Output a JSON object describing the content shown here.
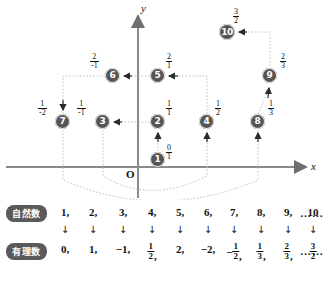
{
  "figure": {
    "axis": {
      "x_label": "x",
      "y_label": "y",
      "origin_label": "O"
    },
    "nodes": [
      {
        "id": "1",
        "label": "1",
        "num": "0",
        "den": "1",
        "x": 158,
        "y": 160,
        "fx": 172,
        "fy": 148
      },
      {
        "id": "2",
        "label": "2",
        "num": "1",
        "den": "1",
        "x": 158,
        "y": 122,
        "fx": 172,
        "fy": 106
      },
      {
        "id": "3",
        "label": "3",
        "num": "1",
        "den": "-1",
        "x": 103,
        "y": 122,
        "fx": 86,
        "fy": 106
      },
      {
        "id": "4",
        "label": "4",
        "num": "1",
        "den": "2",
        "x": 207,
        "y": 122,
        "fx": 222,
        "fy": 106
      },
      {
        "id": "5",
        "label": "5",
        "num": "2",
        "den": "1",
        "x": 158,
        "y": 76,
        "fx": 172,
        "fy": 60
      },
      {
        "id": "6",
        "label": "6",
        "num": "2",
        "den": "-1",
        "x": 113,
        "y": 76,
        "fx": 99,
        "fy": 60
      },
      {
        "id": "7",
        "label": "7",
        "num": "1",
        "den": "-2",
        "x": 63,
        "y": 122,
        "fx": 47,
        "fy": 106
      },
      {
        "id": "8",
        "label": "8",
        "num": "1",
        "den": "3",
        "x": 258,
        "y": 122,
        "fx": 273,
        "fy": 106
      },
      {
        "id": "9",
        "label": "9",
        "num": "2",
        "den": "3",
        "x": 270,
        "y": 76,
        "fx": 285,
        "fy": 60
      },
      {
        "id": "10",
        "label": "10",
        "num": "3",
        "den": "2",
        "x": 227,
        "y": 32,
        "fx": 241,
        "fy": 15
      }
    ]
  },
  "table": {
    "row_labels": {
      "natural": "自然数",
      "rational": "有理数"
    },
    "arrow_glyph": "↓",
    "ellipsis": "……",
    "columns": [
      {
        "x": 65,
        "natural": "1",
        "rational": {
          "sign": "",
          "type": "int",
          "value": "0"
        }
      },
      {
        "x": 93,
        "natural": "2",
        "rational": {
          "sign": "",
          "type": "int",
          "value": "1"
        }
      },
      {
        "x": 123,
        "natural": "3",
        "rational": {
          "sign": "−",
          "type": "int",
          "value": "1"
        }
      },
      {
        "x": 152,
        "natural": "4",
        "rational": {
          "sign": "",
          "type": "frac",
          "num": "1",
          "den": "2"
        }
      },
      {
        "x": 180,
        "natural": "5",
        "rational": {
          "sign": "",
          "type": "int",
          "value": "2"
        }
      },
      {
        "x": 208,
        "natural": "6",
        "rational": {
          "sign": "−",
          "type": "int",
          "value": "2"
        }
      },
      {
        "x": 234,
        "natural": "7",
        "rational": {
          "sign": "−",
          "type": "frac",
          "num": "1",
          "den": "2"
        }
      },
      {
        "x": 261,
        "natural": "8",
        "rational": {
          "sign": "",
          "type": "frac",
          "num": "1",
          "den": "3"
        }
      },
      {
        "x": 288,
        "natural": "9",
        "rational": {
          "sign": "",
          "type": "frac",
          "num": "2",
          "den": "3"
        }
      },
      {
        "x": 313,
        "natural": "10",
        "rational": {
          "sign": "",
          "type": "frac",
          "num": "3",
          "den": "2"
        }
      }
    ]
  },
  "colors": {
    "node_fill": "#555555",
    "axis": "#7a7a7a",
    "path": "#b8b8b8"
  }
}
